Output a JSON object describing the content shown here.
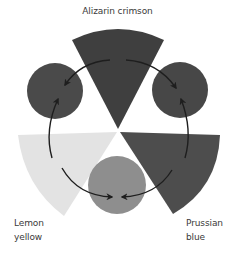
{
  "labels": {
    "top": "Alizarin crimson",
    "left_line1": "Lemon",
    "left_line2": "yellow",
    "right_line1": "Prussian",
    "right_line2": "blue"
  },
  "shapes": {
    "primaries": [
      {
        "name": "Alizarin crimson",
        "shape": "wedge",
        "position": "top",
        "fill": "#3f3f3f"
      },
      {
        "name": "Lemon yellow",
        "shape": "wedge",
        "position": "bottom-left",
        "fill": "#e3e3e3"
      },
      {
        "name": "Prussian blue",
        "shape": "wedge",
        "position": "bottom-right",
        "fill": "#4d4d4d"
      }
    ],
    "mixtures": [
      {
        "shape": "circle",
        "position": "upper-left",
        "fill": "#4a4a4a"
      },
      {
        "shape": "circle",
        "position": "upper-right",
        "fill": "#474747"
      },
      {
        "shape": "circle",
        "position": "bottom",
        "fill": "#8e8e8e"
      }
    ],
    "arrow_color": "#1e1e1e"
  }
}
